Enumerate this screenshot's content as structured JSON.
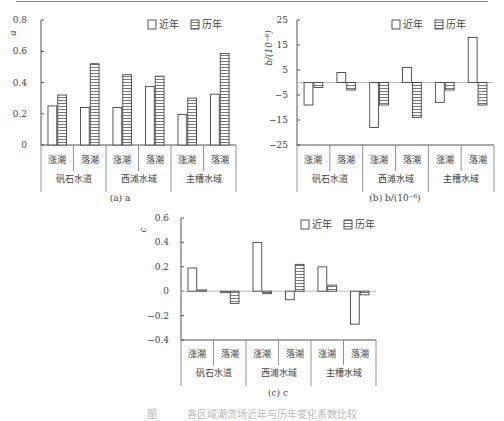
{
  "top_rule": true,
  "legend": {
    "recent": "近年",
    "historical": "历年"
  },
  "categories": [
    "涨潮",
    "落潮",
    "涨潮",
    "落潮",
    "涨潮",
    "落潮"
  ],
  "groups": [
    "矾石水道",
    "西滩水域",
    "主槽水域"
  ],
  "figure_caption": "图　　　各区域潮流场近年与历年变化系数比较",
  "chart_data": [
    {
      "id": "a",
      "type": "bar",
      "title": "(a) a",
      "ylabel": "a",
      "xlabel": "",
      "categories": [
        "矾石水道-涨潮",
        "矾石水道-落潮",
        "西滩水域-涨潮",
        "西滩水域-落潮",
        "主槽水域-涨潮",
        "主槽水域-落潮"
      ],
      "series": [
        {
          "name": "近年",
          "values": [
            0.25,
            0.24,
            0.24,
            0.375,
            0.195,
            0.325
          ]
        },
        {
          "name": "历年",
          "values": [
            0.32,
            0.52,
            0.45,
            0.44,
            0.3,
            0.585
          ]
        }
      ],
      "ylim": [
        0,
        0.8
      ],
      "yticks": [
        "0",
        "0.2",
        "0.4",
        "0.6",
        "0.8"
      ],
      "grid": false,
      "legend_position": "top-right"
    },
    {
      "id": "b",
      "type": "bar",
      "title": "(b) b/(10⁻⁶)",
      "ylabel": "b/(10⁻⁶)",
      "xlabel": "",
      "categories": [
        "矾石水道-涨潮",
        "矾石水道-落潮",
        "西滩水域-涨潮",
        "西滩水域-落潮",
        "主槽水域-涨潮",
        "主槽水域-落潮"
      ],
      "series": [
        {
          "name": "近年",
          "values": [
            -9,
            4,
            -18,
            6,
            -8,
            18
          ]
        },
        {
          "name": "历年",
          "values": [
            -2,
            -3,
            -9,
            -14,
            -3,
            -9
          ]
        }
      ],
      "ylim": [
        -25,
        25
      ],
      "yticks": [
        "-25",
        "-15",
        "-5",
        "5",
        "15",
        "25"
      ],
      "grid": false,
      "legend_position": "top-right"
    },
    {
      "id": "c",
      "type": "bar",
      "title": "(c) c",
      "ylabel": "c",
      "xlabel": "",
      "categories": [
        "矾石水道-涨潮",
        "矾石水道-落潮",
        "西滩水域-涨潮",
        "西滩水域-落潮",
        "主槽水域-涨潮",
        "主槽水域-落潮"
      ],
      "series": [
        {
          "name": "近年",
          "values": [
            0.19,
            -0.01,
            0.4,
            -0.07,
            0.2,
            -0.27
          ]
        },
        {
          "name": "历年",
          "values": [
            0.01,
            -0.1,
            -0.02,
            0.22,
            0.05,
            -0.03
          ]
        }
      ],
      "ylim": [
        -0.4,
        0.6
      ],
      "yticks": [
        "-0.4",
        "-0.2",
        "0",
        "0.2",
        "0.4",
        "0.6"
      ],
      "grid": false,
      "legend_position": "top-right"
    }
  ],
  "layout": [
    {
      "x0": 41,
      "x1": 236,
      "ytop": 20,
      "ybot": 145,
      "labelRow1": 163,
      "labelRow2": 182,
      "captionY": 201,
      "captionX": 120,
      "ylabelX": 16,
      "ylabelY": 33,
      "tickLabelX": 27,
      "legendX": 148,
      "legendY": 21
    },
    {
      "x0": 297,
      "x1": 494,
      "ytop": 20,
      "ybot": 145,
      "labelRow1": 163,
      "labelRow2": 182,
      "captionY": 201,
      "captionX": 395,
      "ylabelX": 272,
      "ylabelY": 48,
      "tickLabelX": 288,
      "legendX": 392,
      "legendY": 21
    },
    {
      "x0": 181,
      "x1": 376,
      "ytop": 218,
      "ybot": 340,
      "labelRow1": 357,
      "labelRow2": 376,
      "captionY": 396,
      "captionX": 278,
      "ylabelX": 146,
      "ylabelY": 230,
      "tickLabelX": 169,
      "legendX": 301,
      "legendY": 221
    }
  ]
}
